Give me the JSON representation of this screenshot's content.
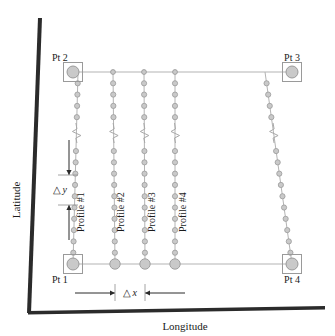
{
  "figure": {
    "type": "survey-track-diagram",
    "axes": {
      "x_label": "Longitude",
      "y_label": "Latitude",
      "x_ticks": [],
      "y_ticks": [],
      "grid": false
    },
    "corner_points": [
      {
        "id": "pt1",
        "label": "Pt 1",
        "x": 73,
        "y": 264,
        "label_x": 52,
        "label_y": 283,
        "anchor": "start"
      },
      {
        "id": "pt2",
        "label": "Pt 2",
        "x": 73,
        "y": 72,
        "label_x": 52,
        "label_y": 61,
        "anchor": "start"
      },
      {
        "id": "pt3",
        "label": "Pt 3",
        "x": 292,
        "y": 72,
        "label_x": 292,
        "label_y": 61,
        "anchor": "middle"
      },
      {
        "id": "pt4",
        "label": "Pt 4",
        "x": 292,
        "y": 264,
        "label_x": 292,
        "label_y": 283,
        "anchor": "middle"
      }
    ],
    "profiles": [
      {
        "label": "Profile #1",
        "x_top": 78,
        "x_bottom": 73,
        "label_x": 84,
        "label_y": 232,
        "break_y": 133,
        "dots": 17,
        "dot_r": 2.6
      },
      {
        "label": "Profile #2",
        "x_top": 113,
        "x_bottom": 115,
        "label_x": 124,
        "label_y": 232,
        "break_y": 133,
        "dots": 17,
        "dot_r": 2.6
      },
      {
        "label": "Profile #3",
        "x_top": 144,
        "x_bottom": 145,
        "label_x": 155,
        "label_y": 232,
        "break_y": 133,
        "dots": 17,
        "dot_r": 2.6
      },
      {
        "label": "Profile #4",
        "x_top": 175,
        "x_bottom": 175,
        "label_x": 186,
        "label_y": 232,
        "break_y": 133,
        "dots": 17,
        "dot_r": 2.6
      },
      {
        "label": "",
        "x_top": 265,
        "x_bottom": 292,
        "label_x": 0,
        "label_y": 0,
        "break_y": 133,
        "dots": 17,
        "dot_r": 2.6
      }
    ],
    "dimensions": [
      {
        "id": "dx",
        "symbol": "△",
        "variable": "x",
        "label": "△ x",
        "orientation": "horizontal",
        "from_x": 115,
        "to_x": 145,
        "y": 293,
        "text_x": 130,
        "text_y": 296
      },
      {
        "id": "dy",
        "symbol": "△",
        "variable": "y",
        "label": "△ y",
        "orientation": "vertical",
        "x": 69,
        "from_y": 175,
        "to_y": 205,
        "text_x": 60,
        "text_y": 193
      }
    ],
    "track_line_top": {
      "x1": 73,
      "y1": 72,
      "x2": 292,
      "y2": 72
    },
    "track_line_bottom": {
      "x1": 73,
      "y1": 264,
      "x2": 292,
      "y2": 264
    },
    "top_edge_dots": [
      {
        "x": 113,
        "r": 2.4
      },
      {
        "x": 144,
        "r": 2.4
      },
      {
        "x": 175,
        "r": 2.4
      }
    ],
    "bottom_edge_dots": [
      {
        "x": 115,
        "r": 5.2
      },
      {
        "x": 145,
        "r": 5.2
      },
      {
        "x": 175,
        "r": 5.2
      }
    ],
    "colors": {
      "marker_fill": "#c9c9c9",
      "marker_stroke": "#9a9a9a",
      "track_line": "#b4b4b4",
      "axis": "#2b2b2b",
      "text": "#1a1a1a",
      "break_symbol": "#a8a8a8",
      "background": "#ffffff"
    }
  }
}
